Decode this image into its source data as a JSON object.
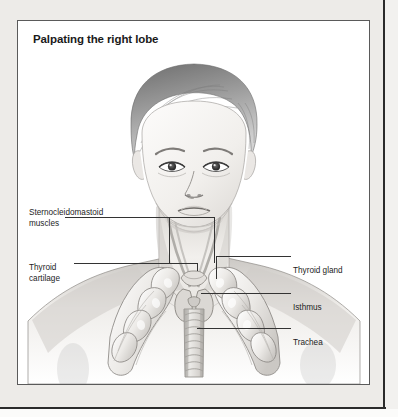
{
  "figure": {
    "title": "Palpating the right lobe",
    "type": "medical-illustration",
    "style": "grayscale pencil drawing",
    "labels": [
      {
        "id": "sternocleidomastoid",
        "text_line1": "Sternocleidomastoid",
        "text_line2": "muscles",
        "side": "left",
        "points_to": "the paired strap muscles running down each side of the neck"
      },
      {
        "id": "thyroid-cartilage",
        "text_line1": "Thyroid",
        "text_line2": "cartilage",
        "side": "left",
        "points_to": "the laryngeal prominence above the thyroid gland"
      },
      {
        "id": "thyroid-gland",
        "text_line1": "Thyroid gland",
        "text_line2": "",
        "side": "right",
        "points_to": "the right lobe of the thyroid gland"
      },
      {
        "id": "isthmus",
        "text_line1": "Isthmus",
        "text_line2": "",
        "side": "right",
        "points_to": "the band of tissue joining the two thyroid lobes"
      },
      {
        "id": "trachea",
        "text_line1": "Trachea",
        "text_line2": "",
        "side": "right",
        "points_to": "the cartilaginous rings of the windpipe"
      }
    ]
  },
  "colors": {
    "page_background": "#edebe8",
    "panel_background": "#ffffff",
    "panel_border": "#5a5a5a",
    "title_text": "#1a1a1a",
    "label_text": "#1d1d1d",
    "leader_line": "#333333",
    "ink_dark": "#4a4a4a",
    "ink_mid": "#8d8d8d",
    "ink_light": "#cfcfcf",
    "skin_tone": "#f4f1ee"
  }
}
